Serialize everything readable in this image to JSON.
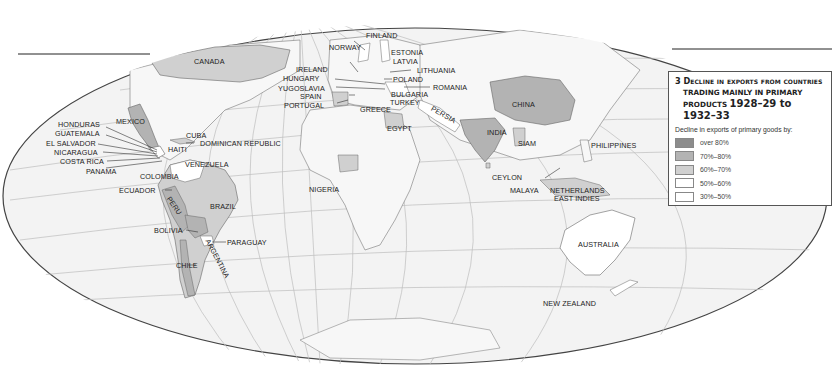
{
  "map": {
    "number": "3",
    "title_line1": "3 Decline in exports from countries",
    "title_line2": "trading mainly in primary",
    "title_line3_prefix": "products ",
    "title_line3_years": "1928–29 to 1932–33",
    "projection": "oval world projection",
    "colors": {
      "ocean": "#f2f2f2",
      "land_default": "#f4f4f4",
      "over_80": "#8c8c8c",
      "p70_80": "#b3b3b3",
      "p60_70": "#d0d0d0",
      "p50_60": "#ffffff",
      "p30_50": "#ffffff",
      "grid": "#b5b5b5",
      "border": "#666666"
    }
  },
  "legend": {
    "subtitle": "Decline in exports of primary goods by:",
    "items": [
      {
        "label": "over 80%",
        "color": "#8c8c8c"
      },
      {
        "label": "70%–80%",
        "color": "#b3b3b3"
      },
      {
        "label": "60%–70%",
        "color": "#d0d0d0"
      },
      {
        "label": "50%–60%",
        "color": "#ffffff"
      },
      {
        "label": "30%–50%",
        "color": "#ffffff"
      }
    ]
  },
  "labels": {
    "canada": "CANADA",
    "mexico": "MEXICO",
    "honduras": "HONDURAS",
    "guatemala": "GUATEMALA",
    "el_salvador": "EL SALVADOR",
    "nicaragua": "NICARAGUA",
    "costa_rica": "COSTA RICA",
    "panama": "PANAMA",
    "cuba": "CUBA",
    "dominican_republic": "DOMINICAN REPUBLIC",
    "haiti": "HAITI",
    "venezuela": "VENEZUELA",
    "colombia": "COLOMBIA",
    "ecuador": "ECUADOR",
    "peru": "PERU",
    "brazil": "BRAZIL",
    "bolivia": "BOLIVIA",
    "paraguay": "PARAGUAY",
    "argentina": "ARGENTINA",
    "chile": "CHILE",
    "finland": "FINLAND",
    "norway": "NORWAY",
    "estonia": "ESTONIA",
    "latvia": "LATVIA",
    "ireland": "IRELAND",
    "lithuania": "LITHUANIA",
    "hungary": "HUNGARY",
    "poland": "POLAND",
    "yugoslavia": "YUGOSLAVIA",
    "romania": "ROMANIA",
    "spain": "SPAIN",
    "bulgaria": "BULGARIA",
    "portugal": "PORTUGAL",
    "turkey": "TURKEY",
    "greece": "GREECE",
    "persia": "PERSIA",
    "egypt": "EGYPT",
    "nigeria": "NIGERIA",
    "india": "INDIA",
    "china": "CHINA",
    "siam": "SIAM",
    "philippines": "PHILIPPINES",
    "ceylon": "CEYLON",
    "malaya": "MALAYA",
    "netherlands_east_indies_1": "NETHERLANDS",
    "netherlands_east_indies_2": "EAST INDIES",
    "australia": "AUSTRALIA",
    "new_zealand": "NEW ZEALAND"
  }
}
